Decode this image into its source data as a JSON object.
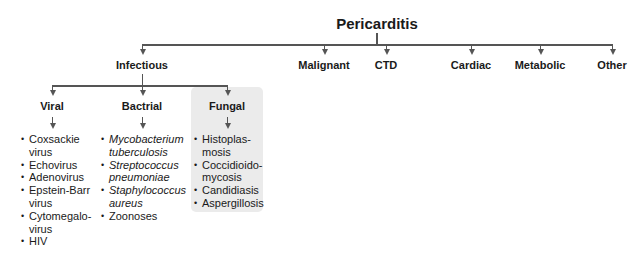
{
  "root": {
    "label": "Pericarditis"
  },
  "categories": [
    {
      "label": "Infectious"
    },
    {
      "label": "Malignant"
    },
    {
      "label": "CTD"
    },
    {
      "label": "Cardiac"
    },
    {
      "label": "Metabolic"
    },
    {
      "label": "Other"
    }
  ],
  "infectious": {
    "subtypes": [
      {
        "label": "Viral",
        "items": [
          "Coxsackie virus",
          "Echovirus",
          "Adenovirus",
          "Epstein-Barr virus",
          "Cytomegalo-virus",
          "HIV"
        ],
        "item_lines": [
          [
            "Coxsackie",
            "virus"
          ],
          [
            "Echovirus"
          ],
          [
            "Adenovirus"
          ],
          [
            "Epstein-Barr",
            "virus"
          ],
          [
            "Cytomegalo-",
            "virus"
          ],
          [
            "HIV"
          ]
        ]
      },
      {
        "label": "Bactrial",
        "items": [
          "Mycobacterium tuberculosis",
          "Streptococcus pneumoniae",
          "Staphylococcus aureus",
          "Zoonoses"
        ],
        "item_lines": [
          [
            "Mycobacterium",
            "tuberculosis"
          ],
          [
            "Streptococcus",
            "pneumoniae"
          ],
          [
            "Staphylococcus",
            "aureus"
          ],
          [
            "Zoonoses"
          ]
        ],
        "italic": [
          true,
          true,
          true,
          false
        ]
      },
      {
        "label": "Fungal",
        "highlighted": true,
        "items": [
          "Histoplas-mosis",
          "Coccidioido-mycosis",
          "Candidiasis",
          "Aspergillosis"
        ],
        "item_lines": [
          [
            "Histoplas-",
            "mosis"
          ],
          [
            "Coccidioido-",
            "mycosis"
          ],
          [
            "Candidiasis"
          ],
          [
            "Aspergillosis"
          ]
        ]
      }
    ]
  },
  "colors": {
    "line": "#555555",
    "highlight_bg": "#ebebeb",
    "text": "#1a1a1a"
  }
}
